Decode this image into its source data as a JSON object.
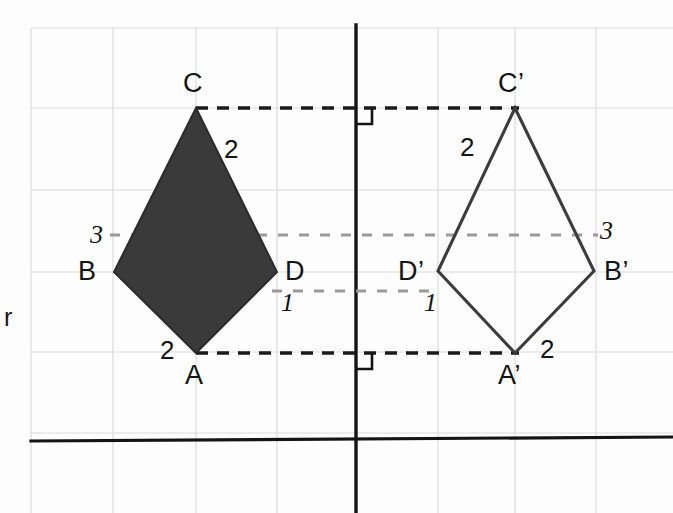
{
  "canvas": {
    "width": 673,
    "height": 513,
    "background": "#fdfdfd"
  },
  "colors": {
    "grid": "#dcdcdc",
    "shape_fill": "#3a3a3a",
    "shape_stroke": "#2b2b2b",
    "outline_stroke": "#3c3c3c",
    "dash_dark": "#1a1a1a",
    "dash_gray": "#9a9a9a",
    "axis_dark": "#141414",
    "text": "#141414"
  },
  "grid": {
    "x_lines": [
      31,
      113,
      196,
      277,
      438,
      515,
      596
    ],
    "y_lines": [
      28,
      108,
      190,
      272,
      352,
      433
    ],
    "left": 31,
    "right": 673,
    "top": 28,
    "bottom": 513
  },
  "mirror_line": {
    "label": "mirror-line",
    "x": 356,
    "y_top": 25,
    "y_bottom": 513
  },
  "baseline": {
    "label": "baseline",
    "x1": 31,
    "y1": 441,
    "x2": 673,
    "y2": 437
  },
  "axis_label": {
    "text": "r",
    "x": 4,
    "y": 305
  },
  "preimage": {
    "name": "kite-ABCD",
    "filled": true,
    "points": "196,108 277,272 196,353 114,272",
    "vertices": [
      {
        "id": "C",
        "label": "C",
        "x": 196,
        "y": 108,
        "label_x": 183,
        "label_y": 70
      },
      {
        "id": "D",
        "label": "D",
        "x": 277,
        "y": 272,
        "label_x": 285,
        "label_y": 258
      },
      {
        "id": "A",
        "label": "A",
        "x": 196,
        "y": 353,
        "label_x": 185,
        "label_y": 362
      },
      {
        "id": "B",
        "label": "B",
        "x": 114,
        "y": 272,
        "label_x": 78,
        "label_y": 258
      }
    ],
    "side_labels": [
      {
        "text": "2",
        "x": 224,
        "y": 136,
        "style": "upright"
      },
      {
        "text": "2",
        "x": 160,
        "y": 337,
        "style": "upright"
      }
    ]
  },
  "image": {
    "name": "kite-A-B-C-D-prime",
    "filled": false,
    "points": "515,108 594,271 515,353 438,271",
    "vertices": [
      {
        "id": "Cp",
        "label": "C’",
        "x": 515,
        "y": 108,
        "label_x": 498,
        "label_y": 70
      },
      {
        "id": "Bp",
        "label": "B’",
        "x": 594,
        "y": 271,
        "label_x": 604,
        "label_y": 258
      },
      {
        "id": "Ap",
        "label": "A’",
        "x": 515,
        "y": 353,
        "label_x": 498,
        "label_y": 362
      },
      {
        "id": "Dp",
        "label": "D’",
        "x": 438,
        "y": 271,
        "label_x": 398,
        "label_y": 258
      }
    ],
    "side_labels": [
      {
        "text": "2",
        "x": 460,
        "y": 134,
        "style": "upright"
      },
      {
        "text": "2",
        "x": 540,
        "y": 336,
        "style": "upright"
      }
    ]
  },
  "measure_labels": [
    {
      "text": "3",
      "x": 90,
      "y": 222,
      "style": "italic"
    },
    {
      "text": "1",
      "x": 281,
      "y": 290,
      "style": "italic"
    },
    {
      "text": "3",
      "x": 600,
      "y": 218,
      "style": "italic"
    },
    {
      "text": "1",
      "x": 424,
      "y": 290,
      "style": "italic"
    }
  ],
  "connectors": [
    {
      "name": "connector-C-to-Cprime",
      "x1": 196,
      "y1": 108,
      "x2": 519,
      "y2": 108,
      "color": "#1a1a1a",
      "width": 3.4,
      "dash": "12,9"
    },
    {
      "name": "connector-A-to-Aprime",
      "x1": 196,
      "y1": 353,
      "x2": 519,
      "y2": 353,
      "color": "#1a1a1a",
      "width": 3.4,
      "dash": "12,9"
    },
    {
      "name": "connector-B-to-Bprime",
      "x1": 110,
      "y1": 235,
      "x2": 598,
      "y2": 235,
      "color": "#9a9a9a",
      "width": 3.2,
      "dash": "10,11"
    },
    {
      "name": "connector-D-to-Dprime",
      "x1": 272,
      "y1": 291,
      "x2": 440,
      "y2": 291,
      "color": "#9a9a9a",
      "width": 3.2,
      "dash": "10,11"
    }
  ],
  "right_angle_marks": [
    {
      "name": "right-angle-mark-top",
      "x": 356,
      "y": 108,
      "size": 16
    },
    {
      "name": "right-angle-mark-bottom",
      "x": 356,
      "y": 353,
      "size": 16
    }
  ]
}
